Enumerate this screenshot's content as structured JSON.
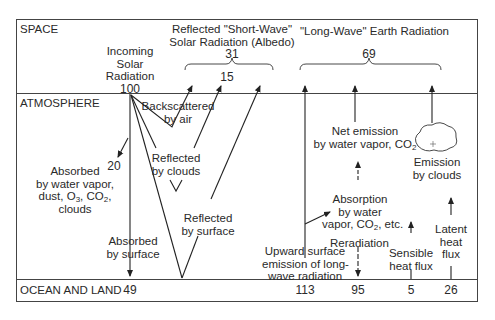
{
  "zones": {
    "space": "SPACE",
    "atmosphere": "ATMOSPHERE",
    "ocean_land": "OCEAN AND LAND"
  },
  "incoming": {
    "line1": "Incoming",
    "line2": "Solar",
    "line3": "Radiation",
    "value": "100"
  },
  "reflected_shortwave": {
    "line1": "Reflected \"Short-Wave\"",
    "line2": "Solar Radiation (Albedo)",
    "total": "31",
    "sub_value": "15"
  },
  "longwave": {
    "title": "\"Long-Wave\" Earth Radiation",
    "total": "69"
  },
  "atmosphere_labels": {
    "backscattered_1": "Backscattered",
    "backscattered_2": "by air",
    "reflected_clouds_1": "Reflected",
    "reflected_clouds_2": "by clouds",
    "reflected_surface_1": "Reflected",
    "reflected_surface_2": "by surface",
    "absorbed_atm_value": "20",
    "absorbed_atm_1": "Absorbed",
    "absorbed_atm_2": "by water vapor,",
    "absorbed_atm_3a": "dust, O",
    "absorbed_atm_3b": "3",
    "absorbed_atm_3c": ", CO",
    "absorbed_atm_3d": "2",
    "absorbed_atm_3e": ",",
    "absorbed_atm_4": "clouds",
    "absorbed_surface_1": "Absorbed",
    "absorbed_surface_2": "by surface",
    "net_emission_1": "Net emission",
    "net_emission_2a": "by water vapor, CO",
    "net_emission_2b": "2",
    "emission_clouds_1": "Emission",
    "emission_clouds_2": "by clouds",
    "absorption_1": "Absorption",
    "absorption_2": "by water",
    "absorption_3a": "vapor, CO",
    "absorption_3b": "2",
    "absorption_3c": ", etc.",
    "reradiation": "Reradiation",
    "upward_1": "Upward surface",
    "upward_2": "emission of long-",
    "upward_3": "wave radiation",
    "sensible_1": "Sensible",
    "sensible_2": "heat flux",
    "latent_1": "Latent",
    "latent_2": "heat",
    "latent_3": "flux"
  },
  "surface_values": {
    "absorbed": "49",
    "upward": "113",
    "reradiation": "95",
    "sensible": "5",
    "latent": "26"
  }
}
